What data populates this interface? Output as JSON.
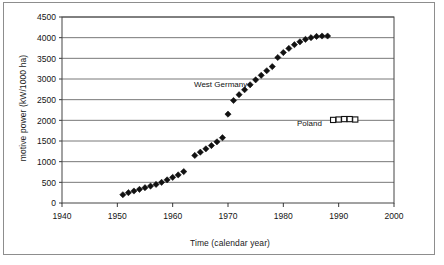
{
  "chart_data": {
    "type": "scatter",
    "title": "",
    "xlabel": "Time (calendar year)",
    "ylabel": "motive power (kW/1000 ha)",
    "xlim": [
      1940,
      2000
    ],
    "ylim": [
      0,
      4500
    ],
    "xticks": [
      1940,
      1950,
      1960,
      1970,
      1980,
      1990,
      2000
    ],
    "yticks": [
      0,
      500,
      1000,
      1500,
      2000,
      2500,
      3000,
      3500,
      4000,
      4500
    ],
    "grid": "horizontal",
    "legend_position": "inline-annotations",
    "series": [
      {
        "name": "West Germany",
        "marker": "filled-diamond",
        "color": "#111111",
        "points": [
          [
            1951,
            200
          ],
          [
            1952,
            250
          ],
          [
            1953,
            290
          ],
          [
            1954,
            330
          ],
          [
            1955,
            370
          ],
          [
            1956,
            410
          ],
          [
            1957,
            450
          ],
          [
            1958,
            500
          ],
          [
            1959,
            560
          ],
          [
            1960,
            620
          ],
          [
            1961,
            680
          ],
          [
            1962,
            760
          ],
          [
            1964,
            1150
          ],
          [
            1965,
            1230
          ],
          [
            1966,
            1310
          ],
          [
            1967,
            1390
          ],
          [
            1968,
            1480
          ],
          [
            1969,
            1580
          ],
          [
            1970,
            2150
          ],
          [
            1971,
            2480
          ],
          [
            1972,
            2620
          ],
          [
            1973,
            2740
          ],
          [
            1974,
            2860
          ],
          [
            1975,
            2980
          ],
          [
            1976,
            3090
          ],
          [
            1977,
            3200
          ],
          [
            1978,
            3300
          ],
          [
            1979,
            3520
          ],
          [
            1980,
            3640
          ],
          [
            1981,
            3740
          ],
          [
            1982,
            3830
          ],
          [
            1983,
            3900
          ],
          [
            1984,
            3960
          ],
          [
            1985,
            4000
          ],
          [
            1986,
            4030
          ],
          [
            1987,
            4040
          ],
          [
            1988,
            4040
          ]
        ]
      },
      {
        "name": "Poland",
        "marker": "open-square",
        "color": "#111111",
        "points": [
          [
            1989,
            2010
          ],
          [
            1990,
            2020
          ],
          [
            1991,
            2030
          ],
          [
            1992,
            2030
          ],
          [
            1993,
            2020
          ]
        ]
      }
    ]
  },
  "annotations": {
    "west_germany": "West Germany",
    "poland": "Poland"
  }
}
